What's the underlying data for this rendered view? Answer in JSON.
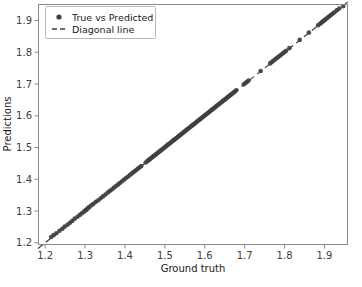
{
  "figure": {
    "background_color": "#ffffff",
    "width": 362,
    "height": 287
  },
  "axes": {
    "frame_color": "#8a8a8a",
    "x_axis_label": "Ground truth",
    "y_axis_label": "Predictions",
    "x_ticks": [
      "1.2",
      "1.3",
      "1.4",
      "1.5",
      "1.6",
      "1.7",
      "1.8",
      "1.9"
    ],
    "y_ticks": [
      "1.2",
      "1.3",
      "1.4",
      "1.5",
      "1.6",
      "1.7",
      "1.8",
      "1.9"
    ]
  },
  "legend": {
    "position": "upper left",
    "border_color": "#b8b8b8",
    "background_color": "#ffffff",
    "entries": [
      {
        "label": "True vs Predicted",
        "marker": "circle",
        "color": "#3f3f3f"
      },
      {
        "label": "Diagonal line",
        "marker": "dashed-line",
        "color": "#3f3f3f"
      }
    ]
  },
  "chart_data": {
    "type": "scatter",
    "title": "",
    "xlabel": "Ground truth",
    "ylabel": "Predictions",
    "xlim": [
      1.182,
      1.959
    ],
    "ylim": [
      1.193,
      1.952
    ],
    "xticks": [
      1.2,
      1.3,
      1.4,
      1.5,
      1.6,
      1.7,
      1.8,
      1.9
    ],
    "yticks": [
      1.2,
      1.3,
      1.4,
      1.5,
      1.6,
      1.7,
      1.8,
      1.9
    ],
    "grid": false,
    "legend_position": "upper left",
    "marker_color": "#3f3f3f",
    "marker_size": 4.6,
    "series": [
      {
        "name": "True vs Predicted",
        "type": "scatter",
        "color": "#3f3f3f",
        "x": [
          1.215,
          1.221,
          1.228,
          1.236,
          1.243,
          1.249,
          1.256,
          1.262,
          1.268,
          1.274,
          1.281,
          1.287,
          1.292,
          1.297,
          1.301,
          1.304,
          1.307,
          1.311,
          1.316,
          1.321,
          1.327,
          1.333,
          1.339,
          1.345,
          1.351,
          1.357,
          1.362,
          1.367,
          1.372,
          1.377,
          1.382,
          1.387,
          1.392,
          1.397,
          1.402,
          1.407,
          1.412,
          1.417,
          1.421,
          1.425,
          1.429,
          1.433,
          1.437,
          1.441,
          1.452,
          1.456,
          1.46,
          1.463,
          1.466,
          1.469,
          1.472,
          1.475,
          1.478,
          1.481,
          1.484,
          1.487,
          1.49,
          1.493,
          1.496,
          1.499,
          1.502,
          1.505,
          1.508,
          1.511,
          1.514,
          1.517,
          1.52,
          1.523,
          1.526,
          1.529,
          1.532,
          1.535,
          1.538,
          1.541,
          1.544,
          1.547,
          1.55,
          1.553,
          1.556,
          1.559,
          1.562,
          1.565,
          1.568,
          1.571,
          1.574,
          1.577,
          1.58,
          1.583,
          1.586,
          1.589,
          1.592,
          1.595,
          1.598,
          1.601,
          1.604,
          1.607,
          1.61,
          1.613,
          1.616,
          1.619,
          1.622,
          1.625,
          1.628,
          1.631,
          1.634,
          1.637,
          1.64,
          1.643,
          1.646,
          1.649,
          1.652,
          1.655,
          1.658,
          1.661,
          1.664,
          1.667,
          1.67,
          1.673,
          1.676,
          1.679,
          1.698,
          1.702,
          1.706,
          1.71,
          1.74,
          1.764,
          1.768,
          1.772,
          1.776,
          1.78,
          1.784,
          1.788,
          1.792,
          1.796,
          1.8,
          1.804,
          1.812,
          1.838,
          1.861,
          1.884,
          1.889,
          1.893,
          1.897,
          1.901,
          1.905,
          1.909,
          1.913,
          1.917,
          1.921,
          1.925,
          1.931,
          1.937,
          1.947
        ],
        "y": [
          1.218,
          1.224,
          1.23,
          1.238,
          1.244,
          1.251,
          1.257,
          1.263,
          1.269,
          1.276,
          1.282,
          1.288,
          1.293,
          1.298,
          1.302,
          1.305,
          1.309,
          1.313,
          1.318,
          1.323,
          1.329,
          1.334,
          1.34,
          1.346,
          1.352,
          1.358,
          1.363,
          1.368,
          1.373,
          1.378,
          1.383,
          1.388,
          1.393,
          1.398,
          1.403,
          1.408,
          1.413,
          1.418,
          1.422,
          1.426,
          1.43,
          1.434,
          1.438,
          1.442,
          1.453,
          1.457,
          1.461,
          1.464,
          1.467,
          1.47,
          1.473,
          1.476,
          1.479,
          1.482,
          1.485,
          1.488,
          1.491,
          1.494,
          1.497,
          1.5,
          1.503,
          1.506,
          1.509,
          1.512,
          1.515,
          1.518,
          1.521,
          1.524,
          1.527,
          1.53,
          1.533,
          1.536,
          1.539,
          1.542,
          1.545,
          1.548,
          1.551,
          1.554,
          1.557,
          1.56,
          1.563,
          1.566,
          1.569,
          1.572,
          1.575,
          1.578,
          1.581,
          1.584,
          1.587,
          1.59,
          1.593,
          1.596,
          1.599,
          1.602,
          1.605,
          1.608,
          1.611,
          1.614,
          1.617,
          1.62,
          1.623,
          1.626,
          1.629,
          1.632,
          1.635,
          1.638,
          1.641,
          1.644,
          1.647,
          1.65,
          1.653,
          1.656,
          1.659,
          1.662,
          1.665,
          1.668,
          1.671,
          1.674,
          1.677,
          1.68,
          1.699,
          1.703,
          1.707,
          1.711,
          1.741,
          1.765,
          1.769,
          1.773,
          1.777,
          1.781,
          1.785,
          1.789,
          1.793,
          1.797,
          1.801,
          1.805,
          1.813,
          1.839,
          1.862,
          1.885,
          1.89,
          1.894,
          1.898,
          1.902,
          1.906,
          1.91,
          1.914,
          1.918,
          1.922,
          1.926,
          1.932,
          1.938,
          1.945
        ]
      },
      {
        "name": "Diagonal line",
        "type": "line",
        "linestyle": "dashed",
        "color": "#3f3f3f",
        "x": [
          1.182,
          1.959
        ],
        "y": [
          1.182,
          1.959
        ]
      }
    ]
  }
}
